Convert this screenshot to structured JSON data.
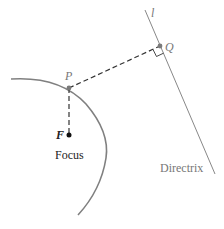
{
  "diagram": {
    "labels": {
      "line": "l",
      "point_q": "Q",
      "point_p": "P",
      "point_f": "F",
      "focus": "Focus",
      "directrix": "Directrix"
    },
    "colors": {
      "curve": "#808080",
      "point_gray": "#7a7a7a",
      "focus_point": "#111111",
      "dashed": "#333333",
      "directrix_line": "#888888",
      "text_gray": "#777777",
      "text_dark": "#222222"
    }
  }
}
